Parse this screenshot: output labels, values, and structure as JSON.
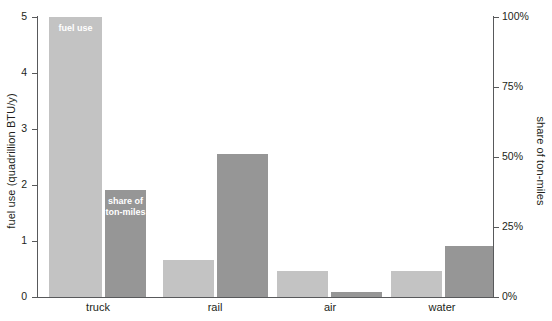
{
  "chart_data": {
    "type": "bar",
    "title": "",
    "categories": [
      "truck",
      "rail",
      "air",
      "water"
    ],
    "series": [
      {
        "name": "fuel use",
        "axis": "left",
        "color": "#c3c3c3",
        "unit": "quadrillion BTU/y",
        "values": [
          5.0,
          0.66,
          0.45,
          0.45
        ]
      },
      {
        "name": "share of ton-miles",
        "axis": "right",
        "color": "#969696",
        "unit": "%",
        "values": [
          38,
          51,
          1.5,
          18
        ]
      }
    ],
    "xlabel": "",
    "ylabel": "fuel use (quadrillion BTU/y)",
    "y2label": "share of ton-miles",
    "ylim": [
      0,
      5
    ],
    "y2lim": [
      0,
      100
    ],
    "yticks": [
      "0",
      "1",
      "2",
      "3",
      "4",
      "5"
    ],
    "ytick_values": [
      0,
      1,
      2,
      3,
      4,
      5
    ],
    "y2ticks": [
      "0%",
      "25%",
      "50%",
      "75%",
      "100%"
    ],
    "y2tick_values": [
      0,
      25,
      50,
      75,
      100
    ],
    "grid": false,
    "legend": "in-bar annotations",
    "annotations": [
      {
        "text": "fuel use",
        "series": "fuel use",
        "category": "truck"
      },
      {
        "text": "share of\nton-miles",
        "series": "share of ton-miles",
        "category": "truck"
      }
    ]
  },
  "labels": {
    "y_axis_left": "fuel use (quadrillion BTU/y)",
    "y_axis_right": "share of ton-miles",
    "bar_label_fuel": "fuel use",
    "bar_label_share_line1": "share of",
    "bar_label_share_line2": "ton-miles",
    "cat_truck": "truck",
    "cat_rail": "rail",
    "cat_air": "air",
    "cat_water": "water",
    "ytick_0": "0",
    "ytick_1": "1",
    "ytick_2": "2",
    "ytick_3": "3",
    "ytick_4": "4",
    "ytick_5": "5",
    "y2tick_0": "0%",
    "y2tick_25": "25%",
    "y2tick_50": "50%",
    "y2tick_75": "75%",
    "y2tick_100": "100%"
  },
  "colors": {
    "fuel_use": "#c3c3c3",
    "share_of_ton_miles": "#969696",
    "axis": "#58595b",
    "text": "#231f20",
    "background": "#ffffff"
  }
}
